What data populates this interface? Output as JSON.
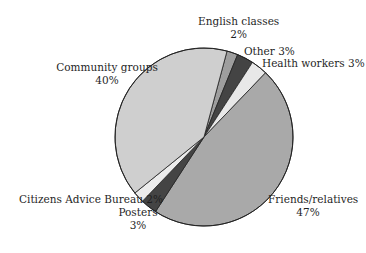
{
  "chart_data": {
    "type": "pie",
    "title": "",
    "start_angle_deg": 15,
    "direction": "clockwise",
    "slices": [
      {
        "label": "English classes",
        "value": 2,
        "display": "2%",
        "color": "#9e9e9e"
      },
      {
        "label": "Other",
        "value": 3,
        "display": "3%",
        "color": "#444444"
      },
      {
        "label": "Health workers",
        "value": 3,
        "display": "3%",
        "color": "#e8e8e8"
      },
      {
        "label": "Friends/relatives",
        "value": 47,
        "display": "47%",
        "color": "#a9a9a9"
      },
      {
        "label": "Posters",
        "value": 3,
        "display": "3%",
        "color": "#444444"
      },
      {
        "label": "Citizens Advice Bureau",
        "value": 2,
        "display": "2%",
        "color": "#ececec"
      },
      {
        "label": "Community groups",
        "value": 40,
        "display": "40%",
        "color": "#cfcfcf"
      }
    ]
  },
  "labels": {
    "english_name": "English classes",
    "english_pct": "2%",
    "other": "Other 3%",
    "health": "Health workers 3%",
    "community_name": "Community groups",
    "community_pct": "40%",
    "cab": "Citizens Advice Bureau 2%",
    "posters_name": "Posters",
    "posters_pct": "3%",
    "friends_name": "Friends/relatives",
    "friends_pct": "47%"
  }
}
